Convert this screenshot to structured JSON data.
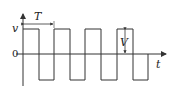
{
  "diagram": {
    "type": "square-wave",
    "labels": {
      "y_axis": "v",
      "x_axis": "t",
      "origin": "0",
      "period": "T",
      "amplitude": "V"
    },
    "colors": {
      "stroke": "#333333",
      "background": "#ffffff"
    }
  }
}
